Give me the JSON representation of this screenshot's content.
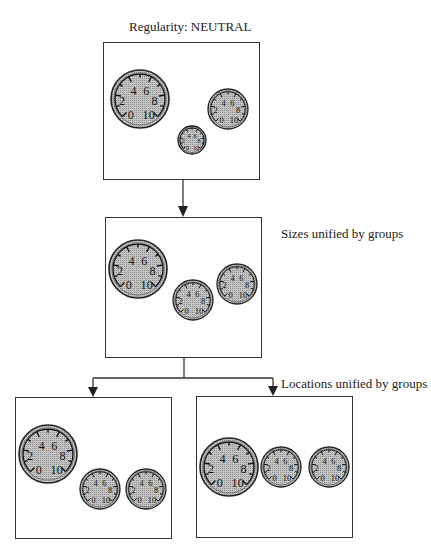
{
  "title": "Regularity:  NEUTRAL",
  "labels": {
    "sizes": "Sizes unified by groups",
    "locations": "Locations unified by groups"
  },
  "colors": {
    "line": "#333333",
    "dial_fill": "#b8b8b8",
    "dial_edge": "#222222"
  },
  "gauge_scale": [
    "0",
    "2",
    "4",
    "6",
    "8",
    "10"
  ],
  "panels": [
    {
      "id": "neutral",
      "box": {
        "x": 103,
        "y": 42,
        "w": 157,
        "h": 138
      },
      "gauges": [
        {
          "cx": 140,
          "cy": 99,
          "r": 29
        },
        {
          "cx": 228,
          "cy": 109,
          "r": 20
        },
        {
          "cx": 192,
          "cy": 140,
          "r": 14
        }
      ]
    },
    {
      "id": "sizes-unified",
      "box": {
        "x": 105,
        "y": 217,
        "w": 157,
        "h": 141
      },
      "gauges": [
        {
          "cx": 138,
          "cy": 269,
          "r": 29
        },
        {
          "cx": 193,
          "cy": 300,
          "r": 20
        },
        {
          "cx": 237,
          "cy": 284,
          "r": 20
        }
      ]
    },
    {
      "id": "locations-unified-left",
      "box": {
        "x": 15,
        "y": 397,
        "w": 157,
        "h": 142
      },
      "gauges": [
        {
          "cx": 48,
          "cy": 454,
          "r": 29
        },
        {
          "cx": 100,
          "cy": 489,
          "r": 20
        },
        {
          "cx": 146,
          "cy": 489,
          "r": 20
        }
      ]
    },
    {
      "id": "locations-unified-right",
      "box": {
        "x": 196,
        "y": 396,
        "w": 157,
        "h": 142
      },
      "gauges": [
        {
          "cx": 229,
          "cy": 467,
          "r": 29
        },
        {
          "cx": 281,
          "cy": 467,
          "r": 20
        },
        {
          "cx": 329,
          "cy": 467,
          "r": 20
        }
      ]
    }
  ]
}
